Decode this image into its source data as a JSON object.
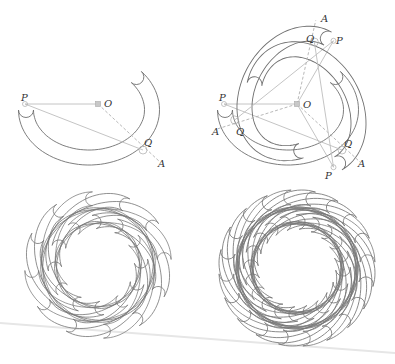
{
  "figure": {
    "panels": [
      {
        "id": "single-band",
        "center": {
          "x": 98,
          "y": 104,
          "label": "O"
        },
        "labels": [
          {
            "text": "P",
            "x": 21,
            "y": 101
          },
          {
            "text": "O",
            "x": 104,
            "y": 107
          },
          {
            "text": "Q",
            "x": 144,
            "y": 146
          },
          {
            "text": "A",
            "x": 158,
            "y": 167
          }
        ],
        "points": {
          "P": [
            25,
            104
          ],
          "O": [
            98,
            104
          ],
          "Q": [
            143,
            150
          ],
          "A": [
            160,
            162
          ]
        }
      },
      {
        "id": "three-bands",
        "center": {
          "x": 297,
          "y": 104,
          "label": "O"
        },
        "rotations_deg": [
          0,
          120,
          240
        ],
        "labels": [
          {
            "text": "O",
            "x": 303,
            "y": 108
          },
          {
            "text": "P",
            "x": 219,
            "y": 101
          },
          {
            "text": "Q",
            "x": 236,
            "y": 135
          },
          {
            "text": "A",
            "x": 212,
            "y": 135
          },
          {
            "text": "A",
            "x": 321,
            "y": 22
          },
          {
            "text": "Q",
            "x": 306,
            "y": 42
          },
          {
            "text": "P",
            "x": 336,
            "y": 44
          },
          {
            "text": "Q",
            "x": 344,
            "y": 147
          },
          {
            "text": "A",
            "x": 358,
            "y": 167
          },
          {
            "text": "P",
            "x": 325,
            "y": 179
          }
        ]
      },
      {
        "id": "rosette-12",
        "center": {
          "x": 98,
          "y": 265
        },
        "copies": 12
      },
      {
        "id": "rosette-20",
        "center": {
          "x": 297,
          "y": 268
        },
        "copies": 20
      }
    ],
    "colors": {
      "curve": "#6f6f6f",
      "guide": "#bdbdbd",
      "label": "#333333"
    }
  }
}
